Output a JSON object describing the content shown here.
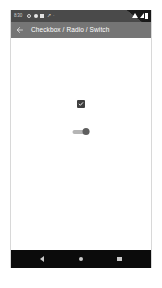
{
  "status_bar": {
    "clock": "8:30",
    "left_icons": [
      "circle-outline-icon",
      "circle-filled-icon",
      "square-icon",
      "chevron-icon",
      "dot-icon"
    ],
    "right_icons": [
      "wifi-icon",
      "signal-icon",
      "battery-icon"
    ],
    "background_color": "#4a4a4a"
  },
  "app_bar": {
    "back_label": "back-arrow",
    "title": "Checkbox / Radio / Switch",
    "background_color": "#757575",
    "text_color": "#ffffff"
  },
  "content": {
    "checkbox": {
      "name": "checkbox",
      "checked": true,
      "checked_color": "#3f3f3f",
      "check_mark": "check-icon"
    },
    "switch": {
      "name": "switch",
      "on": true,
      "track_color": "#b5b5b5",
      "thumb_color": "#5e5e5e"
    },
    "background_color": "#ffffff"
  },
  "nav_bar": {
    "background_color": "#0b0b0b",
    "items": [
      {
        "name": "back",
        "icon": "triangle-back-icon"
      },
      {
        "name": "home",
        "icon": "circle-home-icon"
      },
      {
        "name": "recents",
        "icon": "square-recents-icon"
      }
    ]
  }
}
